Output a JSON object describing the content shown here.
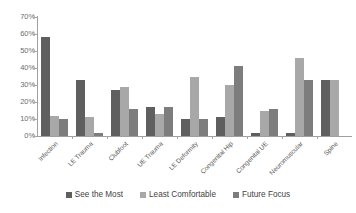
{
  "chart_data": {
    "type": "bar",
    "title": "",
    "xlabel": "",
    "ylabel": "",
    "ylim": [
      0,
      70
    ],
    "ytick_labels": [
      "70%",
      "60%",
      "50%",
      "40%",
      "30%",
      "20%",
      "10%",
      "0%"
    ],
    "ytick_values": [
      70,
      60,
      50,
      40,
      30,
      20,
      10,
      0
    ],
    "grid": false,
    "legend_position": "bottom",
    "categories": [
      "Infection",
      "LE Trauma",
      "Clubfoot",
      "UE Trauma",
      "LE Deformity",
      "Congenital Hip",
      "Congenital UE",
      "Neuromuscular",
      "Spine"
    ],
    "series": [
      {
        "name": "See the Most",
        "color": "#5f5f5f",
        "values": [
          58,
          33,
          27,
          17,
          10,
          11,
          2,
          2,
          33
        ]
      },
      {
        "name": "Least Comfortable",
        "color": "#a8a8a8",
        "values": [
          12,
          11,
          29,
          13,
          35,
          30,
          15,
          46,
          33
        ]
      },
      {
        "name": "Future Focus",
        "color": "#7d7d7d",
        "values": [
          10,
          2,
          16,
          17,
          10,
          41,
          16,
          33,
          0
        ]
      }
    ]
  },
  "legend": {
    "items": [
      {
        "label": "See the Most"
      },
      {
        "label": "Least Comfortable"
      },
      {
        "label": "Future Focus"
      }
    ]
  }
}
